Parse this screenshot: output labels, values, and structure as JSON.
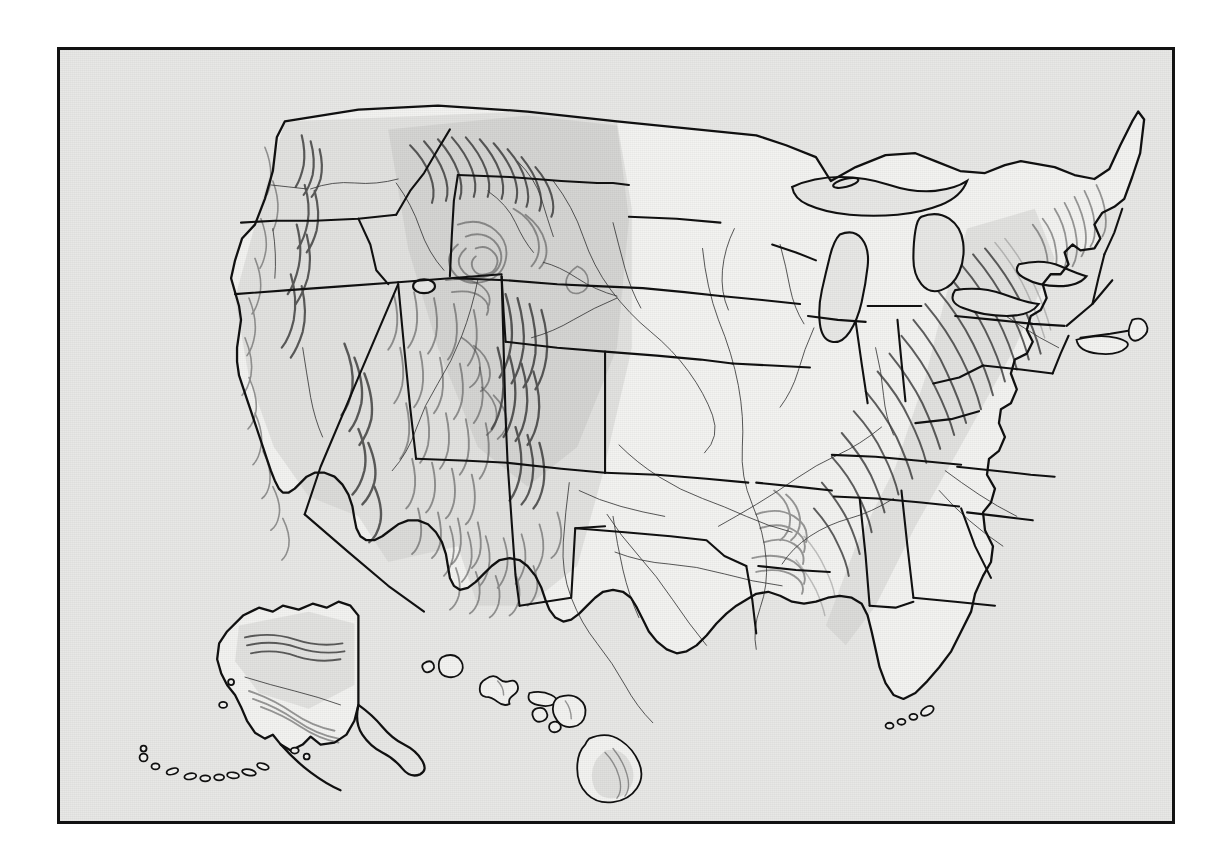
{
  "document": {
    "type": "shaded-relief-map",
    "title": "United States shaded relief map",
    "description": "Black-and-white shaded relief (hillshade) map of the United States with state boundaries, principal rivers, and insets of Alaska and Hawaii",
    "frame": {
      "border_color": "#121212",
      "background_color": "#e8e8e6",
      "page_background": "#ffffff",
      "x": 57,
      "y": 47,
      "width": 1118,
      "height": 777
    },
    "style": {
      "land_fill": "#f3f3f1",
      "boundary_color": "#111111",
      "river_color": "#3a3a3a",
      "relief_shadow": "#262626",
      "relief_midtone": "#4c4c4c",
      "relief_highlight": "#7a7a7a"
    }
  },
  "map_content": {
    "projection_note": "conic, continental US tilted with north edge arcing upward",
    "has_labels": false,
    "has_legend": false,
    "has_scale_bar": false,
    "has_graticule": false,
    "features": {
      "state_boundaries": true,
      "international_boundary": true,
      "coastline": true,
      "rivers": true,
      "great_lakes": true,
      "hillshade": true
    },
    "insets": [
      {
        "name": "Alaska",
        "position": "lower-left"
      },
      {
        "name": "Hawaii",
        "position": "lower-center"
      }
    ],
    "mountain_ranges_depicted": [
      "Coast Ranges",
      "Cascade Range",
      "Sierra Nevada",
      "Basin and Range",
      "Northern Rocky Mountains",
      "Bitterroot Range",
      "Wind River Range",
      "Colorado Rockies / Front Range",
      "Wasatch Range",
      "Colorado Plateau",
      "Sangre de Cristo Mountains",
      "Black Hills",
      "Ozark Plateau",
      "Ouachita Mountains",
      "Appalachian Mountains",
      "Blue Ridge",
      "Allegheny Plateau",
      "Adirondacks",
      "White Mountains",
      "Green Mountains",
      "Brooks Range",
      "Alaska Range",
      "Aleutian Range"
    ],
    "rivers_depicted": [
      "Mississippi River",
      "Missouri River",
      "Ohio River",
      "Arkansas River",
      "Red River",
      "Rio Grande",
      "Colorado River",
      "Columbia River",
      "Snake River",
      "Platte River",
      "Tennessee River",
      "Yukon River"
    ],
    "water_bodies": [
      "Lake Superior",
      "Lake Michigan",
      "Lake Huron",
      "Lake Erie",
      "Lake Ontario",
      "Great Salt Lake",
      "Chesapeake Bay",
      "Gulf of Mexico",
      "Atlantic Ocean",
      "Pacific Ocean"
    ],
    "island_groups": [
      "Florida Keys",
      "Hawaiian Islands",
      "Aleutian Islands",
      "Long Island",
      "Cape Cod"
    ]
  }
}
